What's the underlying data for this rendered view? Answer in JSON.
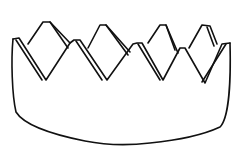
{
  "image": {
    "subject": "crown line drawing",
    "style": "black outline on white",
    "colors": {
      "background": "#ffffff",
      "stroke": "#111111"
    },
    "points_count": 4
  }
}
